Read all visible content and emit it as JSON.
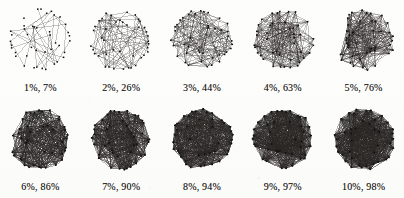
{
  "figure": {
    "kind": "graph-density-series",
    "background_color": "#fdfdfc",
    "ink_color": "#141210",
    "edge_color": "#2a2724",
    "node_color": "#0d0c0b",
    "rows": 2,
    "columns": 5,
    "node_count_per_panel": 42,
    "layout": "circular"
  },
  "chart_data": {
    "type": "scatter",
    "title": "",
    "subtitle": "",
    "xlabel": "",
    "ylabel": "",
    "legend": [],
    "grid": false,
    "series": [
      {
        "name": "edge density vs connectivity",
        "values": [
          7,
          26,
          44,
          63,
          76,
          86,
          90,
          94,
          97,
          98
        ]
      }
    ],
    "categories": [
      "1%",
      "2%",
      "3%",
      "4%",
      "5%",
      "6%",
      "7%",
      "8%",
      "9%",
      "10%"
    ],
    "x": [
      1,
      2,
      3,
      4,
      5,
      6,
      7,
      8,
      9,
      10
    ],
    "panels": [
      {
        "index": 0,
        "label": "1%, 7%",
        "density_pct": 1,
        "coverage_pct": 7,
        "edge_fraction": 0.035,
        "nodes": 42
      },
      {
        "index": 1,
        "label": "2%, 26%",
        "density_pct": 2,
        "coverage_pct": 26,
        "edge_fraction": 0.105,
        "nodes": 42
      },
      {
        "index": 2,
        "label": "3%, 44%",
        "density_pct": 3,
        "coverage_pct": 44,
        "edge_fraction": 0.19,
        "nodes": 42
      },
      {
        "index": 3,
        "label": "4%, 63%",
        "density_pct": 4,
        "coverage_pct": 63,
        "edge_fraction": 0.3,
        "nodes": 42
      },
      {
        "index": 4,
        "label": "5%, 76%",
        "density_pct": 5,
        "coverage_pct": 76,
        "edge_fraction": 0.41,
        "nodes": 42
      },
      {
        "index": 5,
        "label": "6%, 86%",
        "density_pct": 6,
        "coverage_pct": 86,
        "edge_fraction": 0.53,
        "nodes": 42
      },
      {
        "index": 6,
        "label": "7%, 90%",
        "density_pct": 7,
        "coverage_pct": 90,
        "edge_fraction": 0.62,
        "nodes": 42
      },
      {
        "index": 7,
        "label": "8%, 94%",
        "density_pct": 8,
        "coverage_pct": 94,
        "edge_fraction": 0.7,
        "nodes": 42
      },
      {
        "index": 8,
        "label": "9%, 97%",
        "density_pct": 9,
        "coverage_pct": 97,
        "edge_fraction": 0.78,
        "nodes": 42
      },
      {
        "index": 9,
        "label": "10%, 98%",
        "density_pct": 10,
        "coverage_pct": 98,
        "edge_fraction": 0.84,
        "nodes": 42
      }
    ]
  }
}
